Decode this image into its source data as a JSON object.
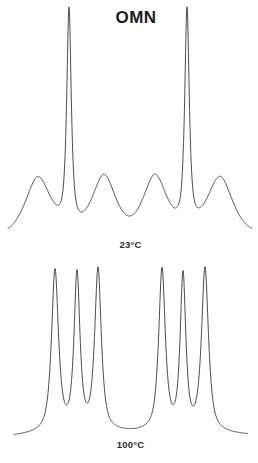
{
  "figure": {
    "title": "OMN",
    "background_color": "#ffffff",
    "trace_color": "#3a3a3a",
    "panels": [
      {
        "name": "top-panel",
        "temperature_label": "23°C"
      },
      {
        "name": "bottom-panel",
        "temperature_label": "100°C"
      }
    ]
  },
  "chart_data": [
    {
      "type": "line",
      "name": "spectrum-23C",
      "title": "OMN",
      "annotations": [
        "23°C"
      ],
      "xlabel": "",
      "ylabel": "",
      "grid": false,
      "legend": "none",
      "xlim": [
        0,
        258
      ],
      "ylim": [
        0,
        1
      ],
      "baseline_y_px": 233,
      "peaks": [
        {
          "index": 1,
          "x_px": 38,
          "apex_y_px": 178,
          "height_rel": 0.26,
          "half_width_px": 13,
          "shape": "broad"
        },
        {
          "index": 2,
          "x_px": 69,
          "apex_y_px": 15,
          "height_rel": 1.0,
          "half_width_px": 2.6,
          "shape": "sharp"
        },
        {
          "index": 3,
          "x_px": 104,
          "apex_y_px": 178,
          "height_rel": 0.26,
          "half_width_px": 12,
          "shape": "broad"
        },
        {
          "index": 4,
          "x_px": 155,
          "apex_y_px": 178,
          "height_rel": 0.26,
          "half_width_px": 12,
          "shape": "broad"
        },
        {
          "index": 5,
          "x_px": 187,
          "apex_y_px": 15,
          "height_rel": 1.0,
          "half_width_px": 2.6,
          "shape": "sharp"
        },
        {
          "index": 6,
          "x_px": 220,
          "apex_y_px": 178,
          "height_rel": 0.26,
          "half_width_px": 13,
          "shape": "broad"
        }
      ]
    },
    {
      "type": "line",
      "name": "spectrum-100C",
      "title": "",
      "annotations": [
        "100°C"
      ],
      "xlabel": "",
      "ylabel": "",
      "grid": false,
      "legend": "none",
      "xlim": [
        0,
        258
      ],
      "ylim": [
        0,
        1
      ],
      "baseline_y_px": 434,
      "peaks": [
        {
          "index": 1,
          "x_px": 55,
          "apex_y_px": 272,
          "height_rel": 1.0,
          "half_width_px": 4.0,
          "shape": "sharp"
        },
        {
          "index": 2,
          "x_px": 77,
          "apex_y_px": 278,
          "height_rel": 0.96,
          "half_width_px": 3.4,
          "shape": "sharp"
        },
        {
          "index": 3,
          "x_px": 98,
          "apex_y_px": 272,
          "height_rel": 1.0,
          "half_width_px": 3.8,
          "shape": "sharp"
        },
        {
          "index": 4,
          "x_px": 162,
          "apex_y_px": 272,
          "height_rel": 1.0,
          "half_width_px": 3.8,
          "shape": "sharp"
        },
        {
          "index": 5,
          "x_px": 183,
          "apex_y_px": 279,
          "height_rel": 0.95,
          "half_width_px": 3.2,
          "shape": "sharp"
        },
        {
          "index": 6,
          "x_px": 205,
          "apex_y_px": 270,
          "height_rel": 1.02,
          "half_width_px": 4.0,
          "shape": "sharp"
        }
      ]
    }
  ]
}
